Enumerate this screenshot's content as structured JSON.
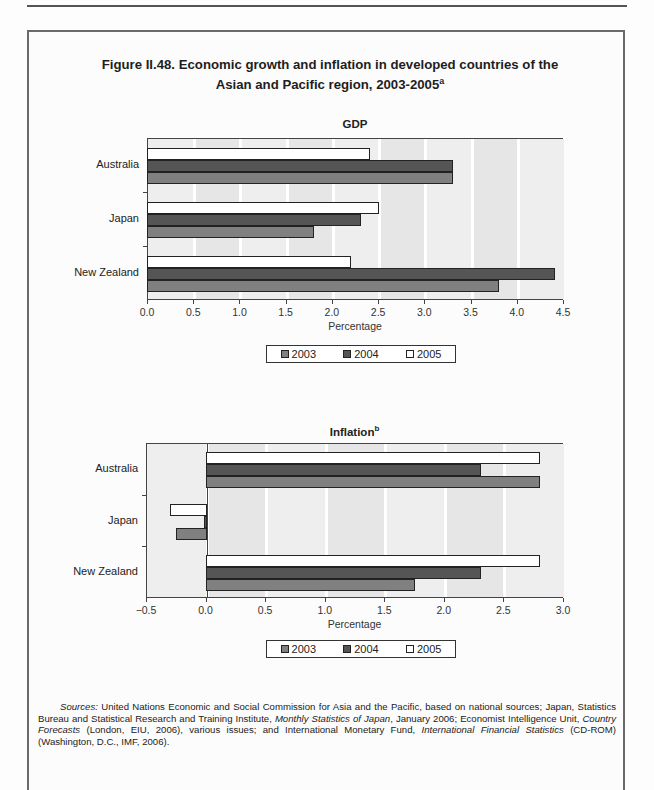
{
  "figure": {
    "title_line1": "Figure II.48. Economic growth and inflation in developed countries of the",
    "title_line2": "Asian and Pacific region, 2003-2005",
    "title_superscript": "a"
  },
  "legend": {
    "items": [
      {
        "label": "2003",
        "color": "#808080"
      },
      {
        "label": "2004",
        "color": "#555555"
      },
      {
        "label": "2005",
        "color": "#ffffff"
      }
    ]
  },
  "chart_data": [
    {
      "type": "bar",
      "orientation": "horizontal",
      "title": "GDP",
      "xlabel": "Percentage",
      "ylabel": "",
      "categories": [
        "Australia",
        "Japan",
        "New Zealand"
      ],
      "series": [
        {
          "name": "2003",
          "values": [
            3.3,
            1.8,
            3.8
          ]
        },
        {
          "name": "2004",
          "values": [
            3.3,
            2.3,
            4.4
          ]
        },
        {
          "name": "2005",
          "values": [
            2.4,
            2.5,
            2.2
          ]
        }
      ],
      "xlim": [
        0.0,
        4.5
      ],
      "xticks": [
        "0.0",
        "0.5",
        "1.0",
        "1.5",
        "2.0",
        "2.5",
        "3.0",
        "3.5",
        "4.0",
        "4.5"
      ],
      "grid": true,
      "legend_position": "bottom"
    },
    {
      "type": "bar",
      "orientation": "horizontal",
      "title": "Inflation",
      "title_superscript": "b",
      "xlabel": "Percentage",
      "ylabel": "",
      "categories": [
        "Australia",
        "Japan",
        "New Zealand"
      ],
      "series": [
        {
          "name": "2003",
          "values": [
            2.8,
            -0.25,
            1.75
          ]
        },
        {
          "name": "2004",
          "values": [
            2.3,
            -0.01,
            2.3
          ]
        },
        {
          "name": "2005",
          "values": [
            2.8,
            -0.3,
            2.8
          ]
        }
      ],
      "xlim": [
        -0.5,
        3.0
      ],
      "xticks": [
        "−0.5",
        "0.0",
        "0.5",
        "1.0",
        "1.5",
        "2.0",
        "2.5",
        "3.0"
      ],
      "grid": true,
      "legend_position": "bottom"
    }
  ],
  "sources": {
    "label": "Sources:",
    "text_1": " United Nations Economic and Social Commission for Asia and the Pacific, based on national sources; Japan, Statistics Bureau and Statistical Research and Training Institute, ",
    "italic_1": "Monthly Statistics of Japan",
    "text_2": ", January 2006; Economist Intelligence Unit, ",
    "italic_2": "Country Forecasts",
    "text_3": " (London, EIU, 2006), various issues; and International Monetary Fund, ",
    "italic_3": "International Financial Statistics",
    "text_4": " (CD-ROM) (Washington, D.C., IMF, 2006)."
  }
}
